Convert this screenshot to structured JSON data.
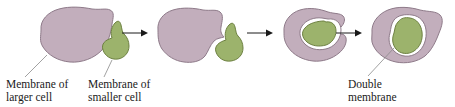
{
  "figure": {
    "background_color": "#ffffff",
    "colors": {
      "larger_cell_fill": "#c2aebc",
      "larger_cell_stroke": "#8e7a89",
      "smaller_cell_fill": "#9cb36c",
      "smaller_cell_stroke": "#6d8141",
      "membrane_gap": "#ffffff",
      "arrow": "#1a1a1a",
      "leader_line": "#8a8a8a",
      "text": "#1a1a1a"
    }
  },
  "labels": {
    "larger_cell": {
      "line1": "Membrane of",
      "line2": "larger cell"
    },
    "smaller_cell": {
      "line1": "Membrane of",
      "line2": "smaller cell"
    },
    "double_membrane": {
      "line1": "Double",
      "line2": "membrane"
    }
  },
  "stages": [
    {
      "index": 1,
      "name": "separate-cells",
      "description": "Larger cell and smaller cell adjacent and separate"
    },
    {
      "index": 2,
      "name": "contact",
      "description": "Larger cell membrane indents around smaller cell"
    },
    {
      "index": 3,
      "name": "engulfing",
      "description": "Smaller cell partially engulfed, double membrane forming"
    },
    {
      "index": 4,
      "name": "engulfed",
      "description": "Smaller cell fully enclosed within double membrane"
    }
  ],
  "arrows": [
    {
      "index": 1,
      "name": "arrow-stage1-to-stage2"
    },
    {
      "index": 2,
      "name": "arrow-stage2-to-stage3"
    },
    {
      "index": 3,
      "name": "arrow-stage3-to-stage4"
    }
  ]
}
